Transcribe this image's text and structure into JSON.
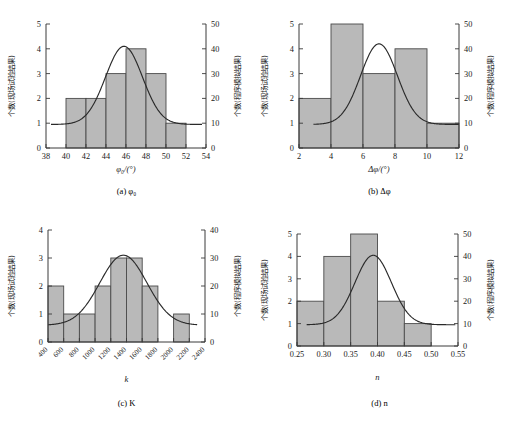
{
  "figure": {
    "background": "#ffffff",
    "bar_fill": "#b9b9b9",
    "bar_stroke": "#4a4a4a",
    "curve_color": "#2a2a2a",
    "left_axis_label": "个数(现场试验结果)",
    "right_axis_label": "个数(程序模拟结果)"
  },
  "chart_data": [
    {
      "id": "a",
      "type": "bar",
      "title": "(a) φ0",
      "caption": "(a) φ₀",
      "xlabel": "φ₀/(°)",
      "ylabel": "个数(现场试验结果)",
      "y2label": "个数(程序模拟结果)",
      "xlim": [
        38,
        54
      ],
      "xticks": [
        "38",
        "40",
        "42",
        "44",
        "46",
        "48",
        "50",
        "52",
        "54"
      ],
      "xtick_values": [
        38,
        40,
        42,
        44,
        46,
        48,
        50,
        52,
        54
      ],
      "ylim": [
        0,
        5
      ],
      "yticks": [
        "0",
        "1",
        "2",
        "3",
        "4",
        "5"
      ],
      "ytick_values": [
        0,
        1,
        2,
        3,
        4,
        5
      ],
      "y2lim": [
        0,
        50
      ],
      "y2ticks": [
        "0",
        "10",
        "20",
        "30",
        "40",
        "50"
      ],
      "y2tick_values": [
        0,
        10,
        20,
        30,
        40,
        50
      ],
      "bin_edges": [
        40,
        42,
        44,
        46,
        48,
        50,
        52
      ],
      "values": [
        2,
        2,
        3,
        4,
        3,
        1
      ],
      "curve": {
        "name": "程序模拟结果",
        "mean": 45.8,
        "sigma": 1.85,
        "peak_y": 4.1,
        "baseline_y": 0.95,
        "x_start": 38.5,
        "x_end": 53.6
      },
      "grid": false,
      "legend": "none"
    },
    {
      "id": "b",
      "type": "bar",
      "title": "(b) Δφ",
      "caption": "(b) Δφ",
      "xlabel": "Δφ/(°)",
      "ylabel": "个数(现场试验结果)",
      "y2label": "个数(程序模拟结果)",
      "xlim": [
        2,
        12
      ],
      "xticks": [
        "2",
        "4",
        "6",
        "8",
        "10",
        "12"
      ],
      "xtick_values": [
        2,
        4,
        6,
        8,
        10,
        12
      ],
      "ylim": [
        0,
        5
      ],
      "yticks": [
        "0",
        "1",
        "2",
        "3",
        "4",
        "5"
      ],
      "ytick_values": [
        0,
        1,
        2,
        3,
        4,
        5
      ],
      "y2lim": [
        0,
        50
      ],
      "y2ticks": [
        "0",
        "10",
        "20",
        "30",
        "40",
        "50"
      ],
      "y2tick_values": [
        0,
        10,
        20,
        30,
        40,
        50
      ],
      "bin_edges": [
        2,
        4,
        6,
        8,
        10,
        12
      ],
      "values": [
        2,
        5,
        3,
        4,
        1
      ],
      "curve": {
        "name": "程序模拟结果",
        "mean": 7.0,
        "sigma": 1.15,
        "peak_y": 4.2,
        "baseline_y": 0.95,
        "x_start": 2.9,
        "x_end": 12.0
      },
      "grid": false,
      "legend": "none"
    },
    {
      "id": "c",
      "type": "bar",
      "title": "(c) K",
      "caption": "(c) K",
      "xlabel": "k",
      "ylabel": "个数(现场试验结果)",
      "y2label": "个数(程序模拟结果)",
      "xlim": [
        400,
        2400
      ],
      "xticks": [
        "400",
        "600",
        "800",
        "1000",
        "1200",
        "1400",
        "1600",
        "1800",
        "2000",
        "2200",
        "2400"
      ],
      "xtick_values": [
        400,
        600,
        800,
        1000,
        1200,
        1400,
        1600,
        1800,
        2000,
        2200,
        2400
      ],
      "xtick_rotation": -45,
      "ylim": [
        0,
        4
      ],
      "yticks": [
        "0",
        "1",
        "2",
        "3",
        "4"
      ],
      "ytick_values": [
        0,
        1,
        2,
        3,
        4
      ],
      "y2lim": [
        0,
        40
      ],
      "y2ticks": [
        "0",
        "10",
        "20",
        "30",
        "40"
      ],
      "y2tick_values": [
        0,
        10,
        20,
        30,
        40
      ],
      "bin_edges": [
        400,
        600,
        800,
        1000,
        1200,
        1400,
        1600,
        1800,
        2000,
        2200,
        2400
      ],
      "values": [
        2,
        1,
        1,
        2,
        3,
        3,
        2,
        0,
        1,
        0
      ],
      "curve": {
        "name": "程序模拟结果",
        "mean": 1360,
        "sigma": 300,
        "peak_y": 3.1,
        "baseline_y": 0.6,
        "x_start": 400,
        "x_end": 2300
      },
      "grid": false,
      "legend": "none"
    },
    {
      "id": "d",
      "type": "bar",
      "title": "(d) n",
      "caption": "(d) n",
      "xlabel": "n",
      "ylabel": "个数(现场试验结果)",
      "y2label": "个数(程序模拟结果)",
      "xlim": [
        0.25,
        0.55
      ],
      "xticks": [
        "0.25",
        "0.30",
        "0.35",
        "0.40",
        "0.45",
        "0.50",
        "0.55"
      ],
      "xtick_values": [
        0.25,
        0.3,
        0.35,
        0.4,
        0.45,
        0.5,
        0.55
      ],
      "ylim": [
        0,
        5
      ],
      "yticks": [
        "0",
        "1",
        "2",
        "3",
        "4",
        "5"
      ],
      "ytick_values": [
        0,
        1,
        2,
        3,
        4,
        5
      ],
      "y2lim": [
        0,
        50
      ],
      "y2ticks": [
        "0",
        "10",
        "20",
        "30",
        "40",
        "50"
      ],
      "y2tick_values": [
        0,
        10,
        20,
        30,
        40,
        50
      ],
      "bin_edges": [
        0.25,
        0.3,
        0.35,
        0.4,
        0.45,
        0.5
      ],
      "values": [
        2,
        4,
        5,
        2,
        1
      ],
      "curve": {
        "name": "程序模拟结果",
        "mean": 0.392,
        "sigma": 0.034,
        "peak_y": 4.05,
        "baseline_y": 0.95,
        "x_start": 0.268,
        "x_end": 0.545
      },
      "grid": false,
      "legend": "none"
    }
  ]
}
